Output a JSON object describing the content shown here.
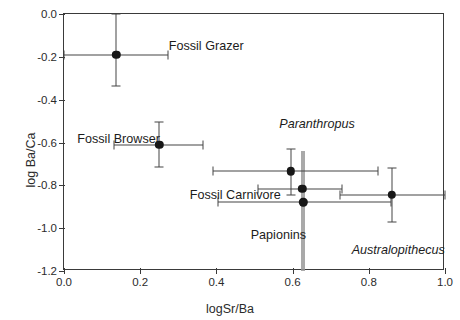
{
  "chart_data": {
    "type": "scatter",
    "title": "",
    "xlabel": "logSr/Ba",
    "ylabel": "log Ba/Ca",
    "xlim": [
      0.0,
      1.0
    ],
    "ylim": [
      -1.2,
      0.0
    ],
    "xticks": [
      "0.0",
      "0.2",
      "0.4",
      "0.6",
      "0.8",
      "1.0"
    ],
    "xtick_values": [
      0.0,
      0.2,
      0.4,
      0.6,
      0.8,
      1.0
    ],
    "yticks": [
      "0.0",
      "-0.2",
      "-0.4",
      "-0.6",
      "-0.8",
      "-1.0",
      "-1.2"
    ],
    "ytick_values": [
      0.0,
      -0.2,
      -0.4,
      -0.6,
      -0.8,
      -1.0,
      -1.2
    ],
    "grid": false,
    "legend": "none",
    "marker_style": "filled-circle",
    "marker_color": "#171717",
    "errorbar_color": "#454545",
    "frame_color": "#3a3a3a",
    "annotations": [
      {
        "text": "Fossil Grazer",
        "x": 0.275,
        "y": -0.12,
        "italic": false
      },
      {
        "text": "Fossil Browser",
        "x": 0.035,
        "y": -0.555,
        "italic": false
      },
      {
        "text": "Paranthropus",
        "x": 0.565,
        "y": -0.485,
        "italic": true
      },
      {
        "text": "Fossil Carnivore",
        "x": 0.33,
        "y": -0.815,
        "italic": false
      },
      {
        "text": "Papionins",
        "x": 0.49,
        "y": -1.005,
        "italic": false
      },
      {
        "text": "Australopithecus",
        "x": 0.755,
        "y": -1.075,
        "italic": true
      }
    ],
    "points": [
      {
        "label": "Fossil Grazer",
        "x": 0.137,
        "y": -0.19,
        "xerr_low": 0.137,
        "xerr_high": 0.135,
        "yerr_low": 0.145,
        "yerr_high": 0.19
      },
      {
        "label": "Fossil Browser",
        "x": 0.25,
        "y": -0.61,
        "xerr_low": 0.12,
        "xerr_high": 0.115,
        "yerr_low": 0.105,
        "yerr_high": 0.105
      },
      {
        "label": "Paranthropus",
        "x": 0.595,
        "y": -0.735,
        "xerr_low": 0.205,
        "xerr_high": 0.23,
        "yerr_low": 0.11,
        "yerr_high": 0.105
      },
      {
        "label": "Fossil Carnivore",
        "x": 0.625,
        "y": -0.815,
        "xerr_low": 0.115,
        "xerr_high": 0.105,
        "yerr_low": 0.0,
        "yerr_high": 0.0
      },
      {
        "label": "Papionins",
        "x": 0.628,
        "y": -0.88,
        "xerr_low": 0.225,
        "xerr_high": 0.23,
        "yerr_low": 0.0,
        "yerr_high": 0.0
      },
      {
        "label": "Australopithecus",
        "x": 0.86,
        "y": -0.845,
        "xerr_low": 0.135,
        "xerr_high": 0.14,
        "yerr_low": 0.125,
        "yerr_high": 0.125
      }
    ],
    "reference_line": {
      "x": 0.628,
      "orientation": "vertical",
      "color": "#9a9a9a"
    }
  }
}
